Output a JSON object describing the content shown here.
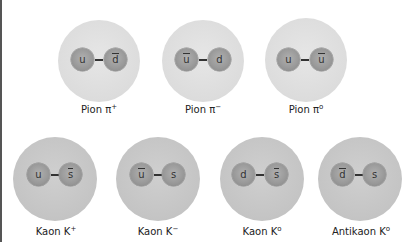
{
  "pions": [
    {
      "name": "Pion",
      "symbol": "π",
      "charge": "+",
      "quarks": [
        {
          "label": "u",
          "anti": false
        },
        {
          "label": "d",
          "anti": true
        }
      ]
    },
    {
      "name": "Pion",
      "symbol": "π",
      "charge": "−",
      "quarks": [
        {
          "label": "u",
          "anti": true
        },
        {
          "label": "d",
          "anti": false
        }
      ]
    },
    {
      "name": "Pion",
      "symbol": "π",
      "charge": "o",
      "quarks": [
        {
          "label": "u",
          "anti": false
        },
        {
          "label": "u",
          "anti": true
        }
      ]
    }
  ],
  "kaons": [
    {
      "name": "Kaon",
      "symbol": "K",
      "charge": "+",
      "quarks": [
        {
          "label": "u",
          "anti": false
        },
        {
          "label": "s",
          "anti": true
        }
      ]
    },
    {
      "name": "Kaon",
      "symbol": "K",
      "charge": "−",
      "quarks": [
        {
          "label": "u",
          "anti": true
        },
        {
          "label": "s",
          "anti": false
        }
      ]
    },
    {
      "name": "Kaon",
      "symbol": "K",
      "charge": "o",
      "quarks": [
        {
          "label": "d",
          "anti": false
        },
        {
          "label": "s",
          "anti": true
        }
      ]
    },
    {
      "name": "Antikaon",
      "symbol": "K",
      "charge": "o",
      "quarks": [
        {
          "label": "d",
          "anti": true
        },
        {
          "label": "s",
          "anti": false
        }
      ]
    }
  ],
  "labels": {
    "pion_plus": "Pion π",
    "pion_minus": "Pion π",
    "pion_zero": "Pion π",
    "kaon_plus": "Kaon K",
    "kaon_minus": "Kaon K",
    "kaon_zero": "Kaon K",
    "antikaon_zero": "Antikaon K"
  },
  "charges": {
    "plus": "+",
    "minus": "−",
    "zero": "o"
  },
  "colors": {
    "pion_cloud": "#dcdcdc",
    "kaon_cloud": "#c4c4c4",
    "quark": "#9a9a9a",
    "text": "#222222"
  }
}
